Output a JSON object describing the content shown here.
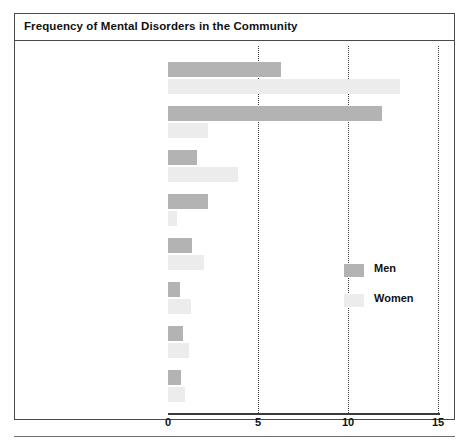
{
  "figure": {
    "title": "Frequency of Mental Disorders in the Community"
  },
  "legend": {
    "items": [
      {
        "label": "Men",
        "swatch": "legend-swatch-men",
        "color": "#b3b3b3"
      },
      {
        "label": "Women",
        "swatch": "legend-swatch-women",
        "color": "#ececec"
      }
    ]
  },
  "axis": {
    "ticks": [
      "0",
      "5",
      "10",
      "15"
    ],
    "tick_values": [
      0,
      5,
      10,
      15
    ]
  },
  "chart_data": {
    "type": "bar",
    "orientation": "horizontal",
    "title": "Frequency of Mental Disorders in the Community",
    "xlabel": "",
    "ylabel": "",
    "xlim": [
      0,
      15
    ],
    "xticks": [
      0,
      5,
      10,
      15
    ],
    "grid": "vertical-dotted",
    "legend_position": "right-middle",
    "categories": [
      "Phobic disorder",
      "Alcohol abuse/dependence",
      "Major depression",
      "Antisocial personality disorder",
      "Obsessive-compulsive disorder",
      "Panic disorder",
      "Schizophrenia",
      "Bipolar mood disorder"
    ],
    "series": [
      {
        "name": "Men",
        "color": "#b3b3b3",
        "values": [
          6.3,
          11.9,
          1.6,
          2.2,
          1.35,
          0.65,
          0.85,
          0.7
        ]
      },
      {
        "name": "Women",
        "color": "#ececec",
        "values": [
          12.9,
          2.2,
          3.9,
          0.5,
          2.0,
          1.3,
          1.15,
          0.95
        ]
      }
    ]
  }
}
